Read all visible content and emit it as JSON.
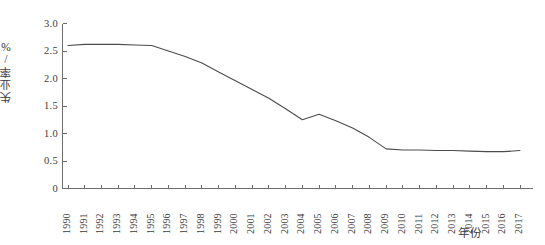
{
  "chart_data": {
    "type": "line",
    "title": "",
    "xlabel": "年份",
    "ylabel": "失业率/%",
    "xlim": [
      1990,
      2017
    ],
    "ylim": [
      0,
      3.0
    ],
    "grid": false,
    "legend": null,
    "ytick_labels": [
      "3.0",
      "2.5",
      "2.0",
      "1.5",
      "1.0",
      "0.5",
      "0"
    ],
    "ytick_values": [
      3.0,
      2.5,
      2.0,
      1.5,
      1.0,
      0.5,
      0
    ],
    "categories": [
      "1990",
      "1991",
      "1992",
      "1993",
      "1994",
      "1995",
      "1996",
      "1997",
      "1998",
      "1999",
      "2000",
      "2001",
      "2002",
      "2003",
      "2004",
      "2005",
      "2006",
      "2007",
      "2008",
      "2009",
      "2010",
      "2011",
      "2012",
      "2013",
      "2014",
      "2015",
      "2016",
      "2017"
    ],
    "x": [
      1990,
      1991,
      1992,
      1993,
      1994,
      1995,
      1996,
      1997,
      1998,
      1999,
      2000,
      2001,
      2002,
      2003,
      2004,
      2005,
      2006,
      2007,
      2008,
      2009,
      2010,
      2011,
      2012,
      2013,
      2014,
      2015,
      2016,
      2017
    ],
    "values": [
      2.6,
      2.62,
      2.62,
      2.62,
      2.61,
      2.6,
      2.5,
      2.4,
      2.28,
      2.12,
      1.96,
      1.8,
      1.64,
      1.45,
      1.25,
      1.35,
      1.23,
      1.1,
      0.93,
      0.72,
      0.7,
      0.7,
      0.69,
      0.69,
      0.68,
      0.67,
      0.67,
      0.69
    ],
    "series_name": "失业率",
    "line_color": "#4c4c4c",
    "axis_color": "#6e6e6e",
    "background_color": "#ffffff"
  }
}
